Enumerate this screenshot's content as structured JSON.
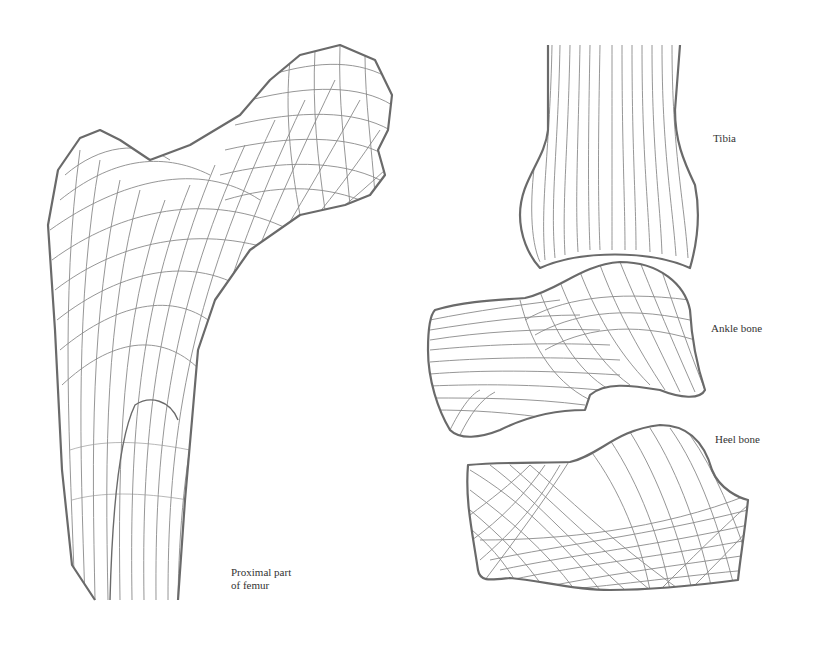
{
  "figure": {
    "type": "anatomical-line-drawing",
    "stroke_color": "#6a6a6a",
    "background": "#ffffff"
  },
  "labels": {
    "femur": {
      "line1": "Proximal part",
      "line2": "of femur"
    },
    "tibia": "Tibia",
    "ankle": "Ankle bone",
    "heel": "Heel bone"
  }
}
